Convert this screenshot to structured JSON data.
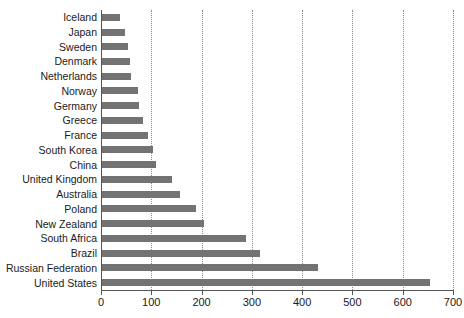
{
  "chart_data": {
    "type": "bar",
    "orientation": "horizontal",
    "title": "",
    "xlabel": "",
    "ylabel": "",
    "xlim": [
      0,
      700
    ],
    "ylim": null,
    "grid": "vertical-dotted",
    "legend": null,
    "bar_color": "#737373",
    "axis_color": "#555555",
    "gridline_color": "#8a8a8a",
    "xticks": [
      0,
      100,
      200,
      300,
      400,
      500,
      600,
      700
    ],
    "xticklabels": [
      "0",
      "100",
      "200",
      "300",
      "400",
      "500",
      "600",
      "700"
    ],
    "gridlines": [
      100,
      200,
      300,
      400,
      500,
      600,
      700
    ],
    "categories": [
      "Iceland",
      "Japan",
      "Sweden",
      "Denmark",
      "Netherlands",
      "Norway",
      "Germany",
      "Greece",
      "France",
      "South Korea",
      "China",
      "United Kingdom",
      "Australia",
      "Poland",
      "New Zealand",
      "South Africa",
      "Brazil",
      "Russian Federation",
      "United States"
    ],
    "values": [
      37,
      47,
      53,
      57,
      59,
      73,
      75,
      83,
      93,
      104,
      110,
      142,
      157,
      189,
      205,
      288,
      317,
      431,
      655
    ]
  }
}
